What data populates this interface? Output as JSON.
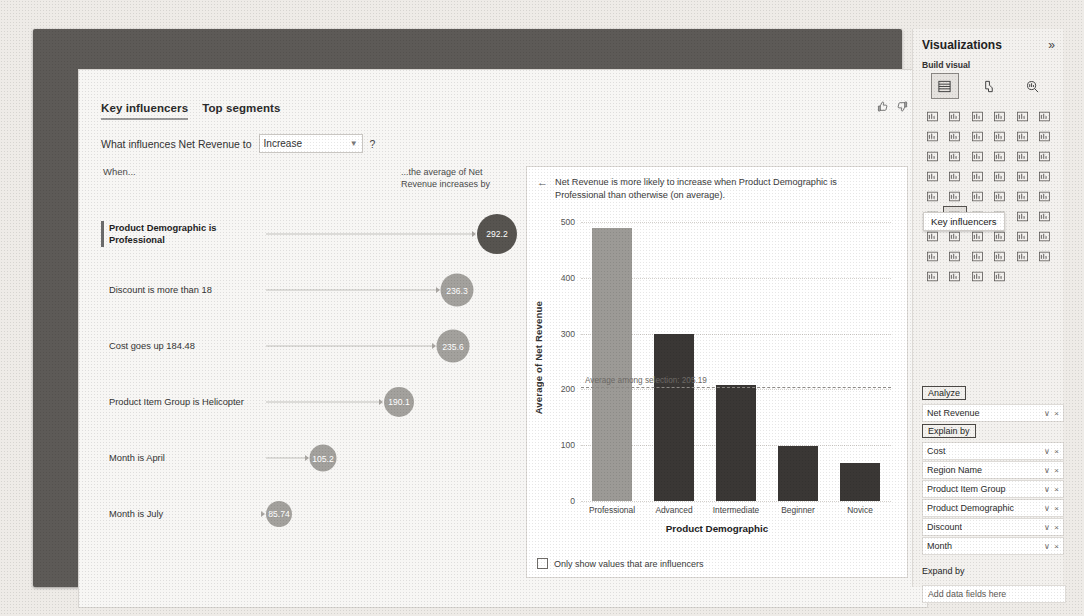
{
  "visual": {
    "tabs": [
      {
        "label": "Key influencers",
        "active": true
      },
      {
        "label": "Top segments",
        "active": false
      }
    ],
    "feedback": {
      "like": "thumbs-up",
      "dislike": "thumbs-down"
    },
    "question": {
      "prefix": "What influences Net Revenue to",
      "selected": "Increase",
      "help": "?"
    },
    "left": {
      "when_label": "When...",
      "average_label": "...the average of Net Revenue increases by",
      "rows": [
        {
          "text": "Product Demographic is Professional",
          "value": "292.2",
          "selected": true,
          "size": 40,
          "cx": 396
        },
        {
          "text": "Discount is more than 18",
          "value": "236.3",
          "selected": false,
          "size": 33,
          "cx": 356
        },
        {
          "text": "Cost goes up 184.48",
          "value": "235.6",
          "selected": false,
          "size": 33,
          "cx": 352
        },
        {
          "text": "Product Item Group is Helicopter",
          "value": "190.1",
          "selected": false,
          "size": 30,
          "cx": 298
        },
        {
          "text": "Month is April",
          "value": "105.2",
          "selected": false,
          "size": 27,
          "cx": 222
        },
        {
          "text": "Month is July",
          "value": "85.74",
          "selected": false,
          "size": 26,
          "cx": 178
        }
      ]
    },
    "detail": {
      "back_icon": "back-arrow-icon",
      "title": "Net Revenue is more likely to increase when Product Demographic is Professional than otherwise (on average).",
      "checkbox_label": "Only show values that are influencers",
      "checked": false
    }
  },
  "chart_data": {
    "type": "bar",
    "title": "",
    "categories": [
      "Professional",
      "Advanced",
      "Intermediate",
      "Beginner",
      "Novice"
    ],
    "values": [
      490,
      300,
      208,
      98,
      68
    ],
    "highlight_index": 0,
    "xlabel": "Product Demographic",
    "ylabel": "Average of Net Revenue",
    "yticks": [
      0,
      100,
      200,
      300,
      400,
      500
    ],
    "ylim": [
      0,
      520
    ],
    "grid": true,
    "reference_line": {
      "value": 205.19,
      "label": "Average among selection: 205.19",
      "style": "dashed"
    },
    "colors": {
      "bar": "#3a3735",
      "highlight": "#9c9a96"
    }
  },
  "pane": {
    "title": "Visualizations",
    "expand_icon": "chevron-double-right-icon",
    "subtitle": "Build visual",
    "modes": [
      {
        "name": "build-visual-icon",
        "active": true
      },
      {
        "name": "format-visual-icon",
        "active": false
      },
      {
        "name": "analytics-icon",
        "active": false
      }
    ],
    "tooltip": "Key influencers",
    "sections": {
      "analyze_label": "Analyze",
      "explain_by_label": "Explain by",
      "expand_by_label": "Expand by"
    },
    "analyze_fields": [
      {
        "name": "Net Revenue"
      }
    ],
    "explain_by_fields": [
      {
        "name": "Cost"
      },
      {
        "name": "Region Name"
      },
      {
        "name": "Product Item Group"
      },
      {
        "name": "Product Demographic"
      },
      {
        "name": "Discount"
      },
      {
        "name": "Month"
      }
    ],
    "expand_by_placeholder": "Add data fields here",
    "field_controls": {
      "chevron": "∨",
      "remove": "×"
    }
  }
}
